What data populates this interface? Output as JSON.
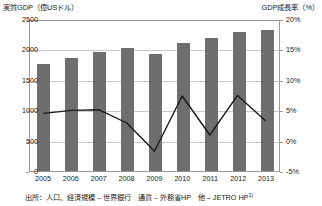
{
  "chart_data": {
    "type": "bar",
    "title": "",
    "categories": [
      "2005",
      "2006",
      "2007",
      "2008",
      "2009",
      "2010",
      "2011",
      "2012",
      "2013"
    ],
    "xlabel": "",
    "grid": true,
    "legend_position": "none",
    "axes": {
      "left": {
        "label": "実質GDP（億USドル）",
        "ticks": [
          "0",
          "500",
          "1000",
          "1500",
          "2000",
          "2500"
        ],
        "tick_values": [
          0,
          500,
          1000,
          1500,
          2000,
          2500
        ],
        "ylim": [
          0,
          2500
        ]
      },
      "right": {
        "label": "GDP成長率（%）",
        "ticks": [
          "-5%",
          "0%",
          "5%",
          "10%",
          "15%",
          "20%"
        ],
        "tick_values": [
          -5,
          0,
          5,
          10,
          15,
          20
        ],
        "ylim": [
          -5,
          20
        ]
      }
    },
    "series": [
      {
        "name": "実質GDP（億USドル）",
        "type": "bar",
        "axis": "left",
        "color": "#6e6e6e",
        "values": [
          1760,
          1860,
          1960,
          2020,
          1930,
          2110,
          2180,
          2290,
          2320
        ]
      },
      {
        "name": "GDP成長率（%）",
        "type": "line",
        "axis": "right",
        "color": "#1a1a1a",
        "values": [
          4.6,
          5.1,
          5.2,
          3.0,
          -1.7,
          7.5,
          1.0,
          7.6,
          3.4
        ]
      }
    ]
  },
  "footnote": {
    "text": "出所：人口、経済規模 – 世界銀行　通貨 – 外務省HP　他 – JETRO HP",
    "marker": "1)"
  }
}
